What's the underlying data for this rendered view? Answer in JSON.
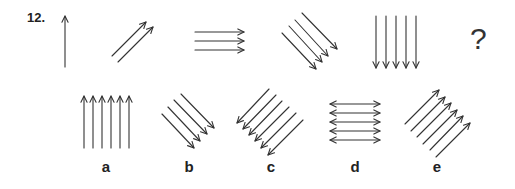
{
  "question": {
    "number": "12.",
    "missing_marker": "?",
    "sequence": [
      {
        "index": 1,
        "arrow_count": 1,
        "direction": "up"
      },
      {
        "index": 2,
        "arrow_count": 2,
        "direction": "up-right"
      },
      {
        "index": 3,
        "arrow_count": 3,
        "direction": "right"
      },
      {
        "index": 4,
        "arrow_count": 4,
        "direction": "down-right"
      },
      {
        "index": 5,
        "arrow_count": 5,
        "direction": "down"
      }
    ]
  },
  "options": [
    {
      "label": "a",
      "arrow_count": 6,
      "direction": "up"
    },
    {
      "label": "b",
      "arrow_count": 4,
      "direction": "down-right"
    },
    {
      "label": "c",
      "arrow_count": 6,
      "direction": "down-left"
    },
    {
      "label": "d",
      "arrow_count": 5,
      "direction": "left-right"
    },
    {
      "label": "e",
      "arrow_count": 6,
      "direction": "up-right"
    }
  ],
  "colors": {
    "stroke": "#333333",
    "background": "#ffffff"
  }
}
